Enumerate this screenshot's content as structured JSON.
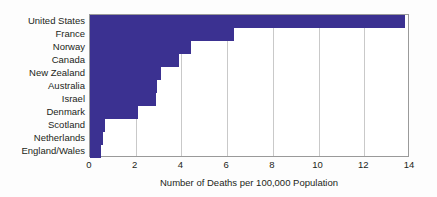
{
  "chart_data": {
    "type": "bar",
    "orientation": "horizontal",
    "title": "",
    "subtitle": "",
    "xlabel": "Number of Deaths per 100,000 Population",
    "ylabel": "",
    "xlim": [
      0,
      14
    ],
    "xticks": [
      0,
      2,
      4,
      6,
      8,
      10,
      12,
      14
    ],
    "xtick_labels": [
      "0",
      "2",
      "4",
      "6",
      "8",
      "10",
      "12",
      "14"
    ],
    "grid": "vertical",
    "legend": "none",
    "categories": [
      "United States",
      "France",
      "Norway",
      "Canada",
      "New Zealand",
      "Australia",
      "Israel",
      "Denmark",
      "Scotland",
      "Netherlands",
      "England/Wales"
    ],
    "values": [
      13.8,
      6.3,
      4.4,
      3.9,
      3.1,
      2.95,
      2.9,
      2.1,
      0.65,
      0.55,
      0.5
    ],
    "series": [
      {
        "name": "Deaths per 100,000 Population",
        "values": [
          13.8,
          6.3,
          4.4,
          3.9,
          3.1,
          2.95,
          2.9,
          2.1,
          0.65,
          0.55,
          0.5
        ]
      }
    ]
  },
  "colors": {
    "bar": "#3b3191",
    "gridline": "#c9c9c9",
    "axis": "#9a9a9a",
    "text": "#231f20",
    "background": "#ffffff"
  }
}
